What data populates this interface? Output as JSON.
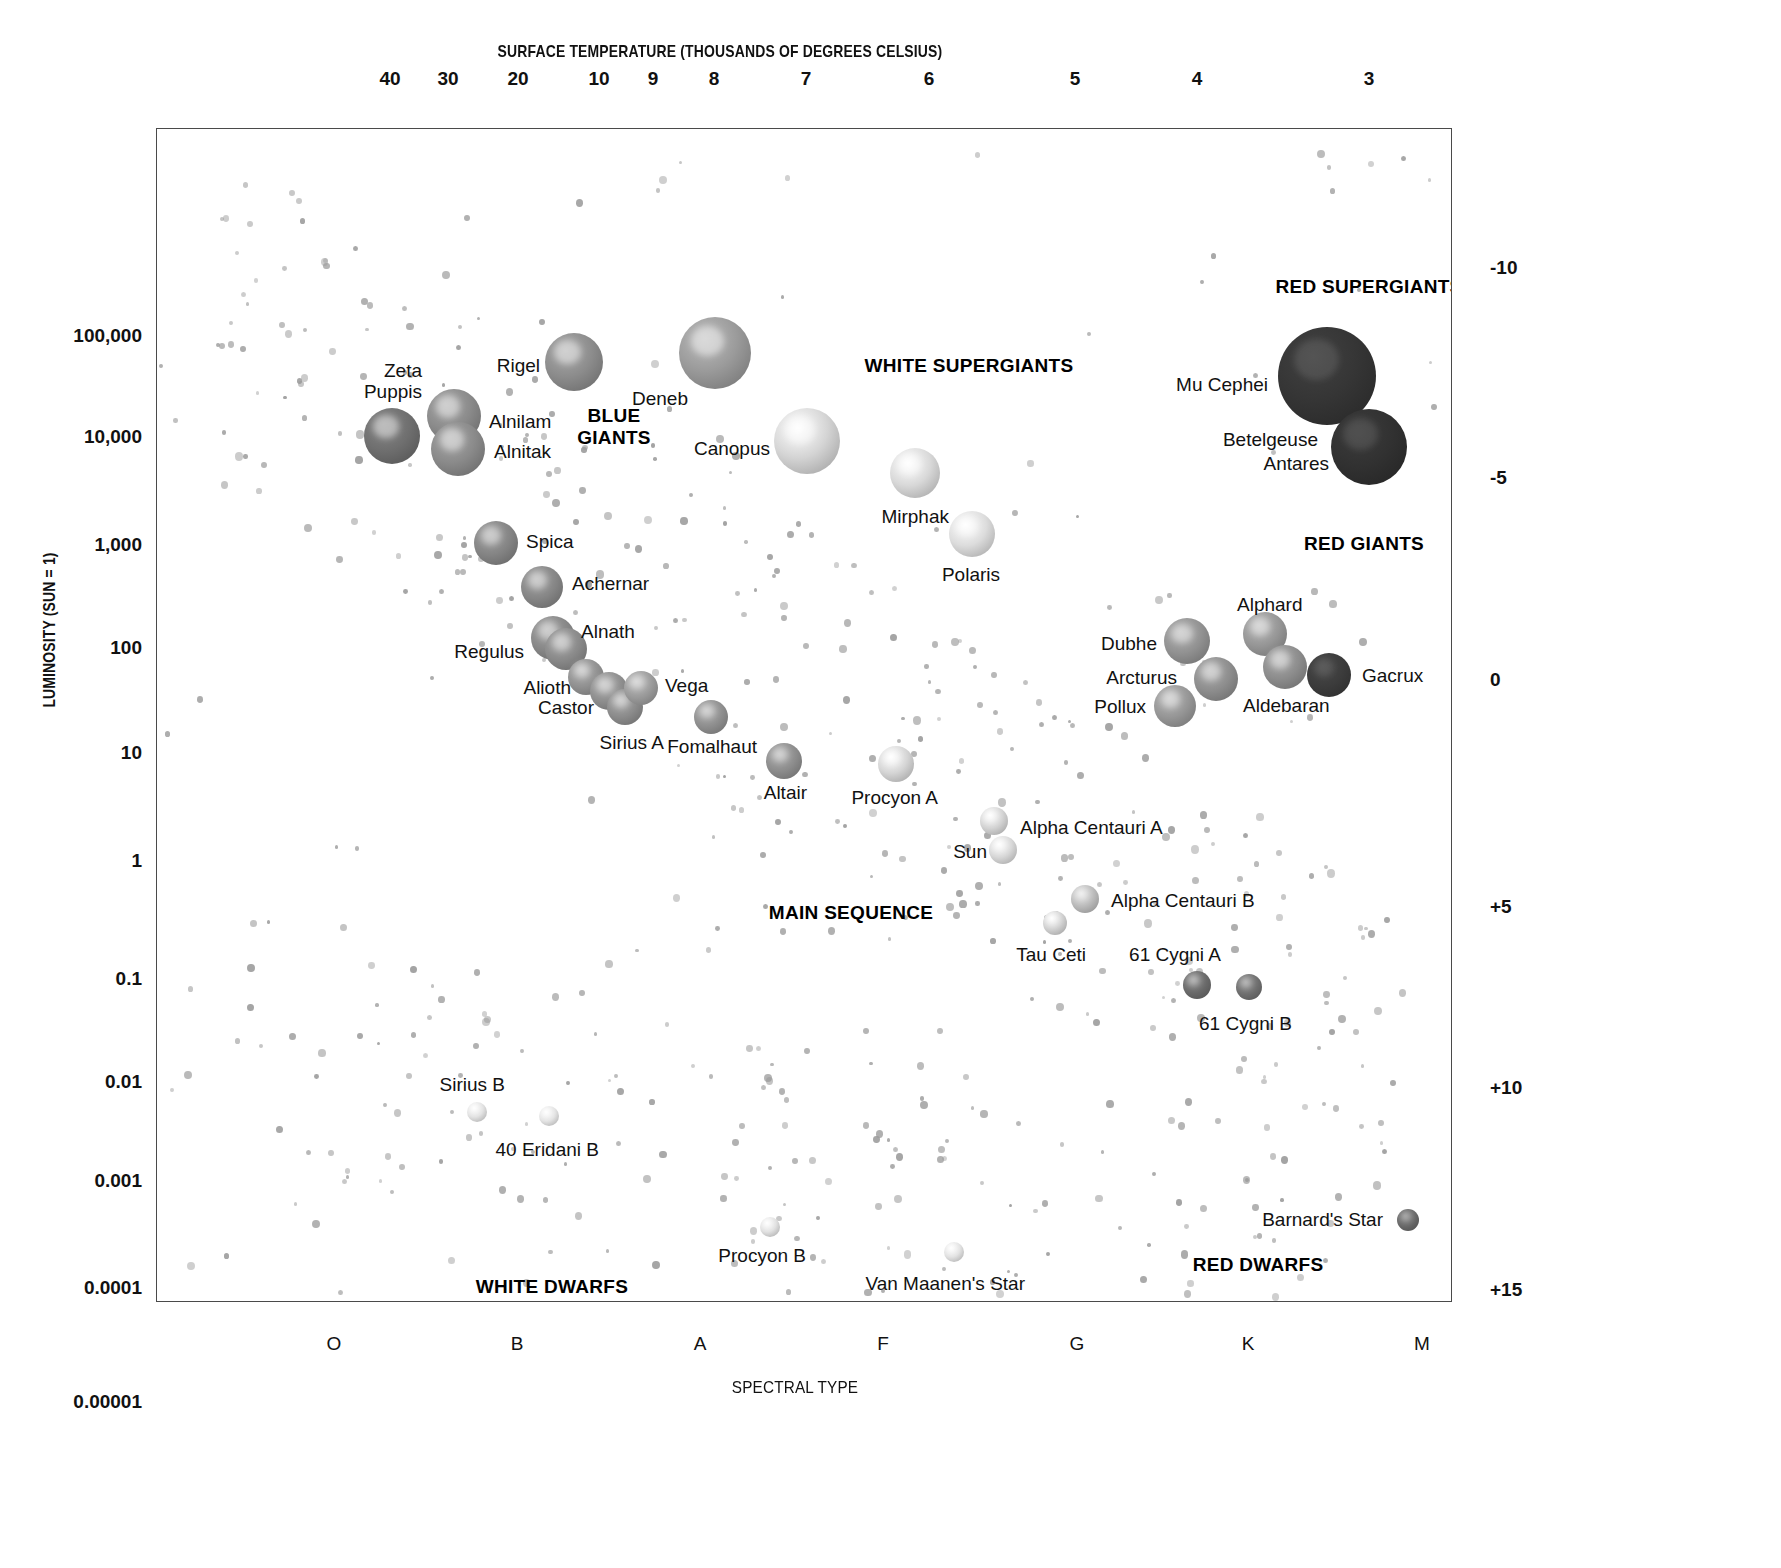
{
  "chart_data": {
    "type": "scatter",
    "top_axis_label": "SURFACE TEMPERATURE (THOUSANDS OF DEGREES CELSIUS)",
    "bottom_axis_label": "SPECTRAL TYPE",
    "left_axis_label": "LUMINOSITY (SUN = 1)",
    "right_axis_label": "ABSOLUTE MAGNITUDE",
    "grid": false,
    "legend": "none",
    "top_ticks": [
      {
        "label": "40",
        "x": 234
      },
      {
        "label": "30",
        "x": 292
      },
      {
        "label": "20",
        "x": 362
      },
      {
        "label": "10",
        "x": 443
      },
      {
        "label": "9",
        "x": 497
      },
      {
        "label": "8",
        "x": 558
      },
      {
        "label": "7",
        "x": 650
      },
      {
        "label": "6",
        "x": 773
      },
      {
        "label": "5",
        "x": 919
      },
      {
        "label": "4",
        "x": 1041
      },
      {
        "label": "3",
        "x": 1213
      }
    ],
    "spectral_ticks": [
      {
        "label": "O",
        "x": 178
      },
      {
        "label": "B",
        "x": 361
      },
      {
        "label": "A",
        "x": 544
      },
      {
        "label": "F",
        "x": 727
      },
      {
        "label": "G",
        "x": 921
      },
      {
        "label": "K",
        "x": 1092
      },
      {
        "label": "M",
        "x": 1266
      }
    ],
    "luminosity_ticks": [
      {
        "label": "100,000",
        "y": 208
      },
      {
        "label": "10,000",
        "y": 309
      },
      {
        "label": "1,000",
        "y": 417
      },
      {
        "label": "100",
        "y": 520
      },
      {
        "label": "10",
        "y": 625
      },
      {
        "label": "1",
        "y": 733
      },
      {
        "label": "0.1",
        "y": 851
      },
      {
        "label": "0.01",
        "y": 954
      },
      {
        "label": "0.001",
        "y": 1053
      },
      {
        "label": "0.0001",
        "y": 1160
      },
      {
        "label": "0.00001",
        "y": 1274
      }
    ],
    "magnitude_ticks": [
      {
        "label": "-10",
        "y": 140
      },
      {
        "label": "-5",
        "y": 350
      },
      {
        "label": "0",
        "y": 552
      },
      {
        "label": "+5",
        "y": 779
      },
      {
        "label": "+10",
        "y": 960
      },
      {
        "label": "+15",
        "y": 1162
      }
    ],
    "regions": [
      {
        "name": "RED SUPERGIANTS",
        "text": "RED SUPERGIANTS",
        "x": 1212,
        "y": 158,
        "align": "c"
      },
      {
        "name": "WHITE SUPERGIANTS",
        "text": "WHITE SUPERGIANTS",
        "x": 812,
        "y": 237,
        "align": "c"
      },
      {
        "name": "BLUE GIANTS",
        "text": "BLUE\nGIANTS",
        "x": 457,
        "y": 298,
        "align": "c"
      },
      {
        "name": "RED GIANTS",
        "text": "RED GIANTS",
        "x": 1207,
        "y": 415,
        "align": "c"
      },
      {
        "name": "MAIN SEQUENCE",
        "text": "MAIN SEQUENCE",
        "x": 694,
        "y": 784,
        "align": "c"
      },
      {
        "name": "WHITE DWARFS",
        "text": "WHITE DWARFS",
        "x": 395,
        "y": 1158,
        "align": "c"
      },
      {
        "name": "RED DWARFS",
        "text": "RED DWARFS",
        "x": 1101,
        "y": 1136,
        "align": "c"
      }
    ],
    "stars": [
      {
        "name": "Zeta Puppis",
        "label": "Zeta\nPuppis",
        "x": 235,
        "y": 307,
        "r": 28,
        "color": "#6f6f6f",
        "lx": 265,
        "ly": 252,
        "lalign": "r"
      },
      {
        "name": "Rigel",
        "label": "Rigel",
        "x": 417,
        "y": 233,
        "r": 29,
        "color": "#8c8c8c",
        "lx": 383,
        "ly": 237,
        "lalign": "r"
      },
      {
        "name": "Alnilam",
        "label": "Alnilam",
        "x": 297,
        "y": 287,
        "r": 27,
        "color": "#8a8a8a",
        "lx": 332,
        "ly": 293,
        "lalign": "l"
      },
      {
        "name": "Alnitak",
        "label": "Alnitak",
        "x": 301,
        "y": 320,
        "r": 27,
        "color": "#8a8a8a",
        "lx": 337,
        "ly": 323,
        "lalign": "l"
      },
      {
        "name": "Deneb",
        "label": "Deneb",
        "x": 558,
        "y": 224,
        "r": 36,
        "color": "#9a9a9a",
        "lx": 531,
        "ly": 270,
        "lalign": "r"
      },
      {
        "name": "Canopus",
        "label": "Canopus",
        "x": 650,
        "y": 312,
        "r": 33,
        "color": "#d4d4d4",
        "lx": 613,
        "ly": 320,
        "lalign": "r"
      },
      {
        "name": "Mirphak",
        "label": "Mirphak",
        "x": 758,
        "y": 344,
        "r": 25,
        "color": "#d8d8d8",
        "lx": 792,
        "ly": 388,
        "lalign": "r"
      },
      {
        "name": "Polaris",
        "label": "Polaris",
        "x": 815,
        "y": 405,
        "r": 23,
        "color": "#dcdcdc",
        "lx": 843,
        "ly": 446,
        "lalign": "r"
      },
      {
        "name": "Spica",
        "label": "Spica",
        "x": 339,
        "y": 414,
        "r": 22,
        "color": "#858585",
        "lx": 369,
        "ly": 413,
        "lalign": "l"
      },
      {
        "name": "Achernar",
        "label": "Achernar",
        "x": 385,
        "y": 458,
        "r": 21,
        "color": "#878787",
        "lx": 415,
        "ly": 455,
        "lalign": "l"
      },
      {
        "name": "Regulus",
        "label": "Regulus",
        "x": 396,
        "y": 509,
        "r": 22,
        "color": "#888888",
        "lx": 367,
        "ly": 523,
        "lalign": "r"
      },
      {
        "name": "Alnath",
        "label": "Alnath",
        "x": 409,
        "y": 520,
        "r": 21,
        "color": "#8a8a8a",
        "lx": 424,
        "ly": 503,
        "lalign": "l"
      },
      {
        "name": "Alioth",
        "label": "Alioth",
        "x": 429,
        "y": 548,
        "r": 18,
        "color": "#929292",
        "lx": 414,
        "ly": 559,
        "lalign": "r"
      },
      {
        "name": "Castor",
        "label": "Castor",
        "x": 452,
        "y": 562,
        "r": 19,
        "color": "#8f8f8f",
        "lx": 437,
        "ly": 579,
        "lalign": "r"
      },
      {
        "name": "Sirius A",
        "label": "Sirius A",
        "x": 468,
        "y": 578,
        "r": 18,
        "color": "#8d8d8d",
        "lx": 507,
        "ly": 614,
        "lalign": "r"
      },
      {
        "name": "Vega",
        "label": "Vega",
        "x": 484,
        "y": 559,
        "r": 17,
        "color": "#9c9c9c",
        "lx": 508,
        "ly": 557,
        "lalign": "l"
      },
      {
        "name": "Fomalhaut",
        "label": "Fomalhaut",
        "x": 554,
        "y": 588,
        "r": 17,
        "color": "#909090",
        "lx": 600,
        "ly": 618,
        "lalign": "r"
      },
      {
        "name": "Altair",
        "label": "Altair",
        "x": 627,
        "y": 632,
        "r": 18,
        "color": "#8e8e8e",
        "lx": 650,
        "ly": 664,
        "lalign": "r"
      },
      {
        "name": "Procyon A",
        "label": "Procyon A",
        "x": 739,
        "y": 635,
        "r": 18,
        "color": "#d5d5d5",
        "lx": 781,
        "ly": 669,
        "lalign": "r"
      },
      {
        "name": "Alpha Centauri A",
        "label": "Alpha Centauri A",
        "x": 837,
        "y": 692,
        "r": 14,
        "color": "#d4d4d4",
        "lx": 863,
        "ly": 699,
        "lalign": "l"
      },
      {
        "name": "Sun",
        "label": "Sun",
        "x": 846,
        "y": 721,
        "r": 14,
        "color": "#d8d8d8",
        "lx": 830,
        "ly": 723,
        "lalign": "r"
      },
      {
        "name": "Alpha Centauri B",
        "label": "Alpha Centauri B",
        "x": 928,
        "y": 770,
        "r": 14,
        "color": "#bcbcbc",
        "lx": 954,
        "ly": 772,
        "lalign": "l"
      },
      {
        "name": "Tau Ceti",
        "label": "Tau Ceti",
        "x": 898,
        "y": 794,
        "r": 12,
        "color": "#d2d2d2",
        "lx": 929,
        "ly": 826,
        "lalign": "r"
      },
      {
        "name": "61 Cygni A",
        "label": "61 Cygni A",
        "x": 1040,
        "y": 856,
        "r": 14,
        "color": "#6b6b6b",
        "lx": 1064,
        "ly": 826,
        "lalign": "r"
      },
      {
        "name": "61 Cygni B",
        "label": "61 Cygni B",
        "x": 1092,
        "y": 858,
        "r": 13,
        "color": "#707070",
        "lx": 1135,
        "ly": 895,
        "lalign": "r"
      },
      {
        "name": "Dubhe",
        "label": "Dubhe",
        "x": 1030,
        "y": 512,
        "r": 23,
        "color": "#929292",
        "lx": 1000,
        "ly": 515,
        "lalign": "r"
      },
      {
        "name": "Arcturus",
        "label": "Arcturus",
        "x": 1059,
        "y": 550,
        "r": 22,
        "color": "#8e8e8e",
        "lx": 1020,
        "ly": 549,
        "lalign": "r"
      },
      {
        "name": "Pollux",
        "label": "Pollux",
        "x": 1018,
        "y": 577,
        "r": 21,
        "color": "#979797",
        "lx": 989,
        "ly": 578,
        "lalign": "r"
      },
      {
        "name": "Alphard",
        "label": "Alphard",
        "x": 1108,
        "y": 505,
        "r": 22,
        "color": "#979797",
        "lx": 1080,
        "ly": 476,
        "lalign": "l"
      },
      {
        "name": "Aldebaran",
        "label": "Aldebaran",
        "x": 1128,
        "y": 538,
        "r": 22,
        "color": "#8d8d8d",
        "lx": 1086,
        "ly": 577,
        "lalign": "l"
      },
      {
        "name": "Gacrux",
        "label": "Gacrux",
        "x": 1172,
        "y": 546,
        "r": 22,
        "color": "#3c3c3c",
        "lx": 1205,
        "ly": 547,
        "lalign": "l"
      },
      {
        "name": "Mu Cephei",
        "label": "Mu Cephei",
        "x": 1170,
        "y": 247,
        "r": 49,
        "color": "#353535",
        "lx": 1111,
        "ly": 256,
        "lalign": "r"
      },
      {
        "name": "Betelgeuse",
        "label": "Betelgeuse",
        "x": 1212,
        "y": 318,
        "r": 38,
        "color": "#313131",
        "lx": 1161,
        "ly": 311,
        "lalign": "r"
      },
      {
        "name": "Antares",
        "label": "Antares",
        "x": 1212,
        "y": 318,
        "r": 0,
        "color": "transparent",
        "lx": 1172,
        "ly": 335,
        "lalign": "r"
      },
      {
        "name": "Sirius B",
        "label": "Sirius B",
        "x": 320,
        "y": 983,
        "r": 10,
        "color": "#e2e2e2",
        "lx": 348,
        "ly": 956,
        "lalign": "r"
      },
      {
        "name": "40 Eridani B",
        "label": "40 Eridani B",
        "x": 392,
        "y": 987,
        "r": 10,
        "color": "#e4e4e4",
        "lx": 442,
        "ly": 1021,
        "lalign": "r"
      },
      {
        "name": "Procyon B",
        "label": "Procyon B",
        "x": 613,
        "y": 1098,
        "r": 10,
        "color": "#e0e0e0",
        "lx": 649,
        "ly": 1127,
        "lalign": "r"
      },
      {
        "name": "Van Maanen's Star",
        "label": "Van Maanen's Star",
        "x": 797,
        "y": 1123,
        "r": 10,
        "color": "#e2e2e2",
        "lx": 868,
        "ly": 1155,
        "lalign": "r"
      },
      {
        "name": "Barnard's Star",
        "label": "Barnard's Star",
        "x": 1251,
        "y": 1091,
        "r": 11,
        "color": "#6a6a6a",
        "lx": 1226,
        "ly": 1091,
        "lalign": "r"
      },
      {
        "name": "Proxima Centauri",
        "label": "Proxima Centauri",
        "x": 1288,
        "y": 1186,
        "r": 13,
        "color": "#585858",
        "lx": 1262,
        "ly": 1187,
        "lalign": "r"
      }
    ]
  }
}
